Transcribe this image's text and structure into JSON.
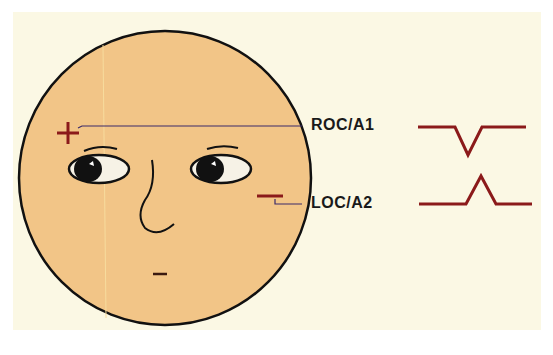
{
  "diagram": {
    "colors": {
      "background": "#fbf8e4",
      "face": "#f2c587",
      "outline": "#111111",
      "marker": "#8b1a1a",
      "lead": "#3a2a6a"
    },
    "face": {
      "positive_marker": "+",
      "negative_marker": "−",
      "reference_marker": "−"
    },
    "channels": [
      {
        "label": "ROC/A1",
        "polarity": "+",
        "waveform": "downward deflection"
      },
      {
        "label": "LOC/A2",
        "polarity": "−",
        "waveform": "upward deflection"
      }
    ]
  }
}
